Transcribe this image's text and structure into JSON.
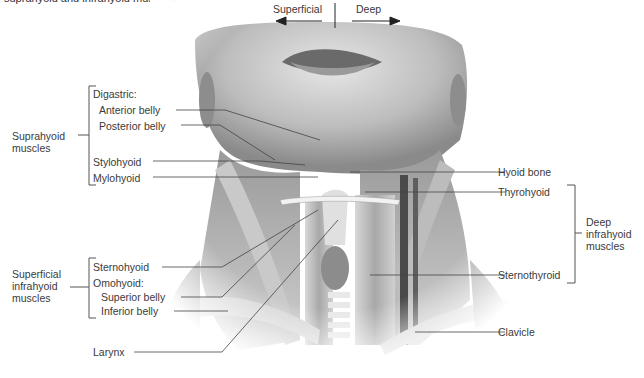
{
  "caption": "suprahyoid and infrahyoid muscles.",
  "orientation": {
    "left_label": "Superficial",
    "right_label": "Deep"
  },
  "groups": {
    "suprahyoid": {
      "title_line1": "Suprahyoid",
      "title_line2": "muscles",
      "items": {
        "digastric": "Digastric:",
        "anterior_belly": "Anterior belly",
        "posterior_belly": "Posterior belly",
        "stylohyoid": "Stylohyoid",
        "mylohyoid": "Mylohyoid"
      }
    },
    "superficial_infrahyoid": {
      "title_line1": "Superficial",
      "title_line2": "infrahyoid",
      "title_line3": "muscles",
      "items": {
        "sternohyoid": "Sternohyoid",
        "omohyoid": "Omohyoid:",
        "superior_belly": "Superior belly",
        "inferior_belly": "Inferior belly"
      }
    },
    "deep_infrahyoid": {
      "title_line1": "Deep",
      "title_line2": "infrahyoid",
      "title_line3": "muscles",
      "items": {
        "thyrohyoid": "Thyrohyoid",
        "sternothyroid": "Sternothyroid"
      }
    }
  },
  "other_labels": {
    "hyoid_bone": "Hyoid bone",
    "larynx": "Larynx",
    "clavicle": "Clavicle"
  }
}
